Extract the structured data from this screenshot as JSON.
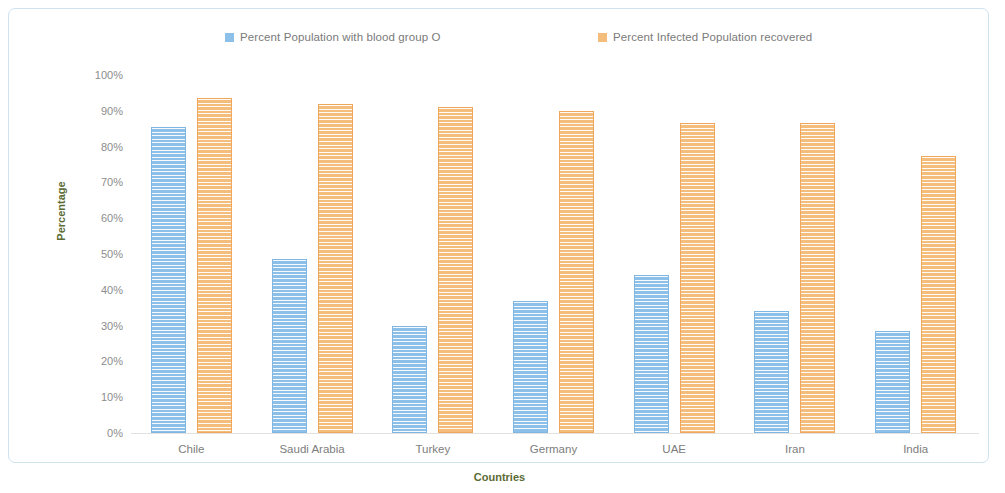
{
  "chart_data": {
    "type": "bar",
    "title": "",
    "xlabel": "Countries",
    "ylabel": "Percentage",
    "categories": [
      "Chile",
      "Saudi Arabia",
      "Turkey",
      "Germany",
      "UAE",
      "Iran",
      "India"
    ],
    "series": [
      {
        "name": "Percent Population with blood group O",
        "color": "#8cc0e8",
        "values": [
          85.5,
          48.5,
          30.0,
          37.0,
          44.0,
          34.0,
          28.5
        ]
      },
      {
        "name": "Percent Infected Population recovered",
        "color": "#f5bd7c",
        "values": [
          93.5,
          92.0,
          91.0,
          90.0,
          86.5,
          86.5,
          77.5
        ]
      }
    ],
    "ylim": [
      0,
      100
    ],
    "ytick_labels": [
      "100%",
      "90%",
      "80%",
      "70%",
      "60%",
      "50%",
      "40%",
      "30%",
      "20%",
      "10%",
      "0%"
    ],
    "ytick_values": [
      100,
      90,
      80,
      70,
      60,
      50,
      40,
      30,
      20,
      10,
      0
    ],
    "grid": false,
    "legend_position": "top",
    "axis_title_color": "#5b6b33",
    "tick_label_color": "#8c8c8c",
    "border_color": "#cfe2f0"
  }
}
